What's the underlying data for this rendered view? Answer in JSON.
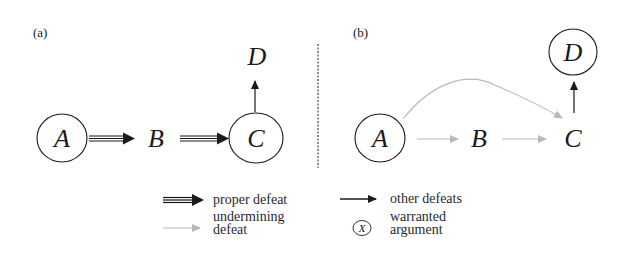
{
  "panels": {
    "a": {
      "tag": "(a)",
      "nodes": {
        "A": {
          "label": "A",
          "warranted": true
        },
        "B": {
          "label": "B",
          "warranted": false
        },
        "C": {
          "label": "C",
          "warranted": true
        },
        "D": {
          "label": "D",
          "warranted": false
        }
      },
      "edges": [
        {
          "from": "A",
          "to": "B",
          "type": "proper defeat"
        },
        {
          "from": "B",
          "to": "C",
          "type": "proper defeat"
        },
        {
          "from": "C",
          "to": "D",
          "type": "other defeat"
        }
      ]
    },
    "b": {
      "tag": "(b)",
      "nodes": {
        "A": {
          "label": "A",
          "warranted": true
        },
        "B": {
          "label": "B",
          "warranted": false
        },
        "C": {
          "label": "C",
          "warranted": false
        },
        "D": {
          "label": "D",
          "warranted": true
        }
      },
      "edges": [
        {
          "from": "A",
          "to": "B",
          "type": "undermining defeat"
        },
        {
          "from": "B",
          "to": "C",
          "type": "undermining defeat"
        },
        {
          "from": "A",
          "to": "C",
          "type": "undermining defeat",
          "curved": true
        },
        {
          "from": "C",
          "to": "D",
          "type": "other defeat"
        }
      ]
    }
  },
  "legend": {
    "proper_defeat": "proper defeat",
    "other_defeats": "other defeats",
    "undermining_line1": "undermining",
    "undermining_line2": "defeat",
    "warranted_symbol": "X",
    "warranted_line1": "warranted",
    "warranted_line2": "argument"
  },
  "colors": {
    "ink": "#1a1a1a",
    "undermining": "#b8b8b8",
    "divider": "#555555"
  }
}
